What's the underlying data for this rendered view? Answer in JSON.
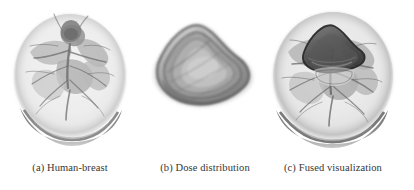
{
  "figure": {
    "background_color": "#ffffff",
    "ink_color": "#363636",
    "panels": [
      {
        "id": "panel-a",
        "label": "(a)",
        "caption": "(a) Human-breast",
        "render_type": "volume-rendering",
        "subject": "human-breast",
        "modality": "grayscale direct volume rendering",
        "has_dose_overlay": false
      },
      {
        "id": "panel-b",
        "label": "(b)",
        "caption": "(b) Dose distribution",
        "render_type": "volume-rendering",
        "subject": "dose-distribution",
        "modality": "grayscale iso-dose volume rendering",
        "has_dose_overlay": false
      },
      {
        "id": "panel-c",
        "label": "(c)",
        "caption": "(c) Fused visualization",
        "render_type": "volume-rendering",
        "subject": "fused-breast-and-dose",
        "modality": "grayscale fused volume rendering",
        "has_dose_overlay": true
      }
    ]
  },
  "render_params": {
    "breast": {
      "outline_cx": 0.5,
      "outline_cy": 0.48,
      "outline_rx": 0.4,
      "outline_ry": 0.455,
      "skin_tone": "#ececec",
      "tissue_tone": "#9a9a9a",
      "vessel_tone": "#6f6f6f",
      "crescent_tone": "#7a7a7a"
    },
    "dose": {
      "tone_outer": "#5c5c5c",
      "tone_mid": "#8d8d8d",
      "tone_inner": "#b4b4b4",
      "tone_core": "#cfcfcf"
    }
  }
}
